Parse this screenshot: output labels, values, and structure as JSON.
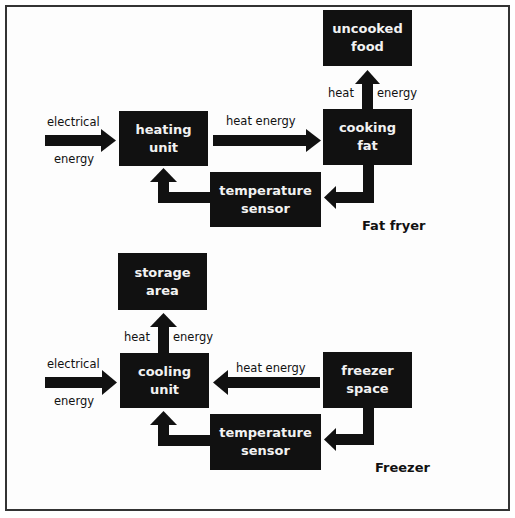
{
  "diagrams": [
    {
      "title": "Fat fryer",
      "nodes": {
        "source_top": "electrical",
        "source_bottom": "energy",
        "main_unit": [
          "heating",
          "unit"
        ],
        "medium": [
          "cooking",
          "fat"
        ],
        "target": [
          "uncooked",
          "food"
        ],
        "sensor": [
          "temperature",
          "sensor"
        ]
      },
      "edges": {
        "main_to_medium": "heat energy",
        "medium_to_target_left": "heat",
        "medium_to_target_right": "energy"
      }
    },
    {
      "title": "Freezer",
      "nodes": {
        "source_top": "electrical",
        "source_bottom": "energy",
        "main_unit": [
          "cooling",
          "unit"
        ],
        "medium": [
          "freezer",
          "space"
        ],
        "target": [
          "storage",
          "area"
        ],
        "sensor": [
          "temperature",
          "sensor"
        ]
      },
      "edges": {
        "medium_to_main": "heat energy",
        "main_to_target_left": "heat",
        "main_to_target_right": "energy"
      }
    }
  ],
  "colors": {
    "box": "#111111",
    "box_text": "#f2f2f2",
    "arrow": "#111111"
  }
}
